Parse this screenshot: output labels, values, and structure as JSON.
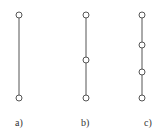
{
  "diagrams": [
    {
      "label": "a)",
      "x": 19,
      "nodes": [
        15,
        98
      ]
    },
    {
      "label": "b)",
      "x": 86,
      "nodes": [
        15,
        60,
        98
      ]
    },
    {
      "label": "c)",
      "x": 142,
      "nodes": [
        15,
        45,
        72,
        98
      ]
    }
  ],
  "colors": {
    "line": "#555555",
    "node_fill": "#ffffff"
  }
}
